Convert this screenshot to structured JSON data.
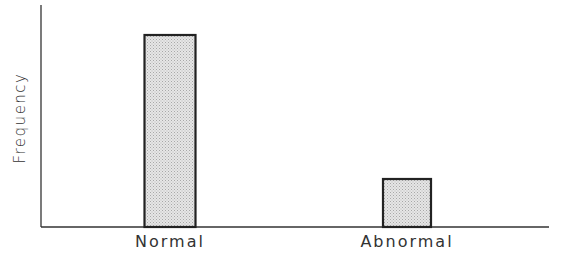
{
  "chart_data": {
    "type": "bar",
    "title": "",
    "xlabel": "",
    "ylabel": "Frequency",
    "categories": [
      "Normal",
      "Abnormal"
    ],
    "values": [
      100,
      25
    ],
    "value_units": "relative (no numeric ticks shown)",
    "ylim": [
      0,
      115
    ],
    "grid": false,
    "legend": null,
    "bar_fill": "#dcdcdc",
    "bar_edge": "#222222"
  },
  "axis": {
    "ylabel": "Frequency",
    "xticks": [
      "Normal",
      "Abnormal"
    ]
  }
}
